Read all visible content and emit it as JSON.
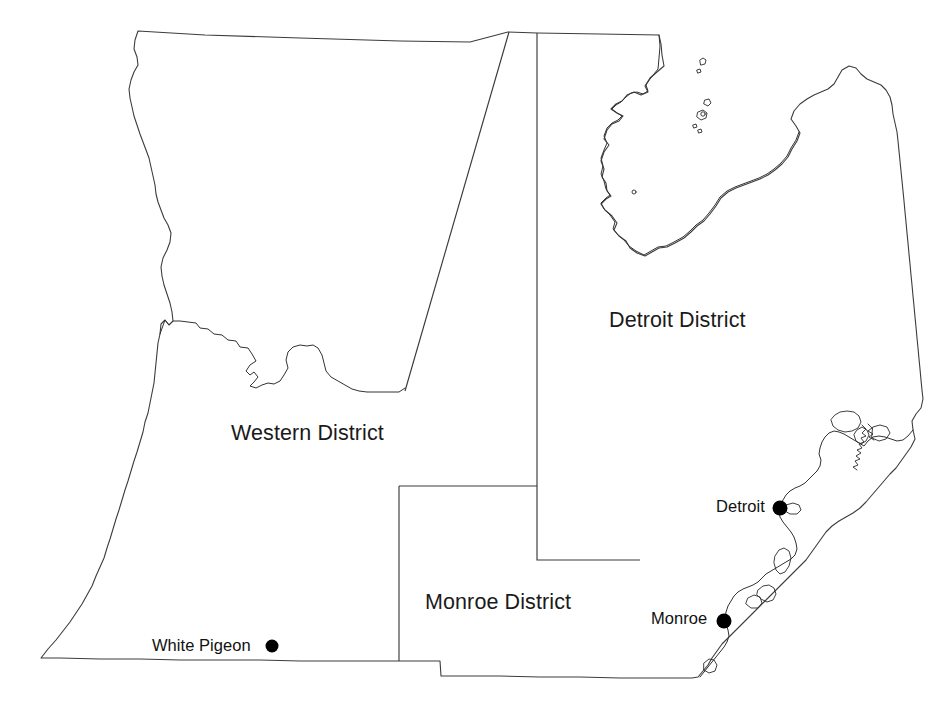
{
  "map": {
    "title": "Michigan Lower Peninsula District Map",
    "background_color": "#ffffff",
    "outline_color": "#3c3c3c",
    "label_color": "#1a1a1a",
    "marker_color": "#000000",
    "districts": [
      {
        "id": "western",
        "label": "Western District",
        "label_x": 231,
        "label_y": 421
      },
      {
        "id": "detroit",
        "label": "Detroit District",
        "label_x": 609,
        "label_y": 308
      },
      {
        "id": "monroe",
        "label": "Monroe District",
        "label_x": 425,
        "label_y": 590
      }
    ],
    "cities": [
      {
        "id": "white-pigeon",
        "label": "White Pigeon",
        "label_x": 152,
        "label_y": 636,
        "dot_x": 272,
        "dot_y": 646,
        "dot_r": 6.5
      },
      {
        "id": "detroit",
        "label": "Detroit",
        "label_x": 716,
        "label_y": 497,
        "dot_x": 780,
        "dot_y": 508,
        "dot_r": 7.5
      },
      {
        "id": "monroe",
        "label": "Monroe",
        "label_x": 651,
        "label_y": 609,
        "dot_x": 724,
        "dot_y": 621,
        "dot_r": 7.5
      }
    ]
  }
}
